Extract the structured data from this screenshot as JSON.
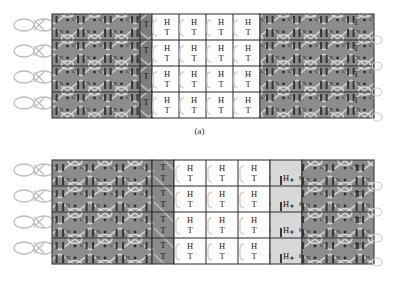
{
  "figure_set": {
    "background_color": "#ffffff",
    "panel_colors": {
      "dark_mesh": "#8c8c8c",
      "dark_mesh_alt": "#7d7d7d",
      "mid_mesh": "#a3a3a3",
      "light_panel": "#d8d8d8",
      "white_panel": "#fdfdfd",
      "yarn_line": "#e8e8e8",
      "outline": "#2a2a2a",
      "text": "#1a1a1a"
    },
    "rows": 4,
    "figures": [
      {
        "id": "a",
        "caption": "(a)",
        "frame": {
          "x": 52,
          "y": 14,
          "width": 322,
          "height": 104
        },
        "loops": {
          "count": 4,
          "side": "left",
          "label": "yarn-loop"
        },
        "bands": [
          {
            "name": "left-dark-mesh",
            "x": 52,
            "width": 88,
            "fill": "#8c8c8c",
            "type": "mesh"
          },
          {
            "name": "left-dark-mesh-b",
            "x": 140,
            "width": 12,
            "fill": "#7d7d7d",
            "type": "mesh"
          },
          {
            "name": "white-cell-block",
            "x": 152,
            "width": 108,
            "fill": "#fdfdfd",
            "type": "cells"
          },
          {
            "name": "right-dark-mesh",
            "x": 260,
            "width": 114,
            "fill": "#8c8c8c",
            "type": "mesh"
          }
        ],
        "cell_columns": [
          {
            "index": 0,
            "x": 152,
            "width": 27,
            "top_label": "H",
            "bottom_label": "T",
            "fill": "#fdfdfd"
          },
          {
            "index": 1,
            "x": 179,
            "width": 27,
            "top_label": "H",
            "bottom_label": "T",
            "fill": "#fdfdfd"
          },
          {
            "index": 2,
            "x": 206,
            "width": 27,
            "top_label": "H",
            "bottom_label": "T",
            "fill": "#fdfdfd"
          },
          {
            "index": 3,
            "x": 233,
            "width": 27,
            "top_label": "H",
            "bottom_label": "T",
            "fill": "#fdfdfd"
          }
        ],
        "left_tick_column": {
          "x": 140,
          "label": "T",
          "fill": "#7d7d7d"
        },
        "right_tick_column": {
          "x": 348,
          "label": "T",
          "fill": "#8c8c8c"
        }
      },
      {
        "id": "b",
        "caption": "(b)",
        "frame": {
          "x": 52,
          "y": 14,
          "width": 322,
          "height": 104
        },
        "loops": {
          "count": 4,
          "side": "left",
          "label": "yarn-loop"
        },
        "bands": [
          {
            "name": "left-dark-mesh",
            "x": 52,
            "width": 100,
            "fill": "#8c8c8c",
            "type": "mesh"
          },
          {
            "name": "left-tick-band",
            "x": 152,
            "width": 22,
            "fill": "#8a8a8a",
            "type": "ticks"
          },
          {
            "name": "white-cell-block",
            "x": 174,
            "width": 96,
            "fill": "#fdfdfd",
            "type": "cells"
          },
          {
            "name": "light-h-band",
            "x": 270,
            "width": 32,
            "fill": "#d8d8d8",
            "type": "cells-h"
          },
          {
            "name": "right-dark-mesh",
            "x": 302,
            "width": 72,
            "fill": "#8c8c8c",
            "type": "mesh"
          }
        ],
        "cell_columns": [
          {
            "index": 0,
            "x": 174,
            "width": 32,
            "top_label": "H",
            "bottom_label": "T",
            "fill": "#fdfdfd"
          },
          {
            "index": 1,
            "x": 206,
            "width": 32,
            "top_label": "H",
            "bottom_label": "T",
            "fill": "#fdfdfd"
          },
          {
            "index": 2,
            "x": 238,
            "width": 32,
            "top_label": "H",
            "bottom_label": "T",
            "fill": "#fdfdfd"
          },
          {
            "index": 3,
            "x": 270,
            "width": 32,
            "top_label": "",
            "bottom_label": "H",
            "fill": "#d8d8d8"
          }
        ],
        "left_tick_column": {
          "x": 152,
          "label": "T",
          "fill": "#8a8a8a"
        },
        "right_tick_column": {
          "x": 350,
          "label": "T",
          "fill": "#8c8c8c"
        }
      }
    ]
  }
}
